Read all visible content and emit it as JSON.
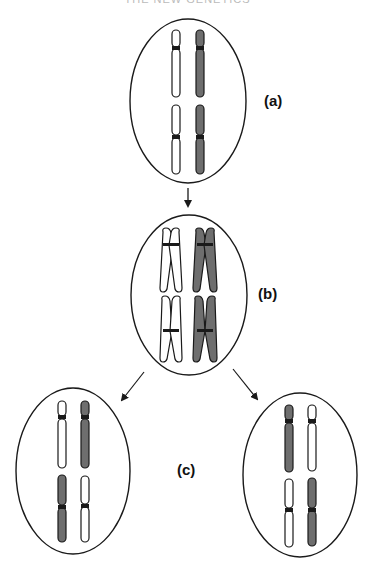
{
  "header": {
    "text": "THE NEW GENETICS"
  },
  "colors": {
    "outline": "#1a1a1a",
    "homolog_light": "#ffffff",
    "homolog_dark": "#6e6e6e",
    "background": "#ffffff"
  },
  "stages": [
    {
      "id": "a",
      "label": "(a)",
      "description": "Cell with two pairs of unreplicated homologous chromosomes"
    },
    {
      "id": "b",
      "label": "(b)",
      "description": "Cell with replicated chromosomes (sister chromatids joined at centromere)"
    },
    {
      "id": "c",
      "label": "(c)",
      "description": "Two daughter cells with different assortments of homologs"
    }
  ],
  "arrows": [
    {
      "from": "a",
      "to": "b"
    },
    {
      "from": "b",
      "to": "c-left"
    },
    {
      "from": "b",
      "to": "c-right"
    }
  ]
}
